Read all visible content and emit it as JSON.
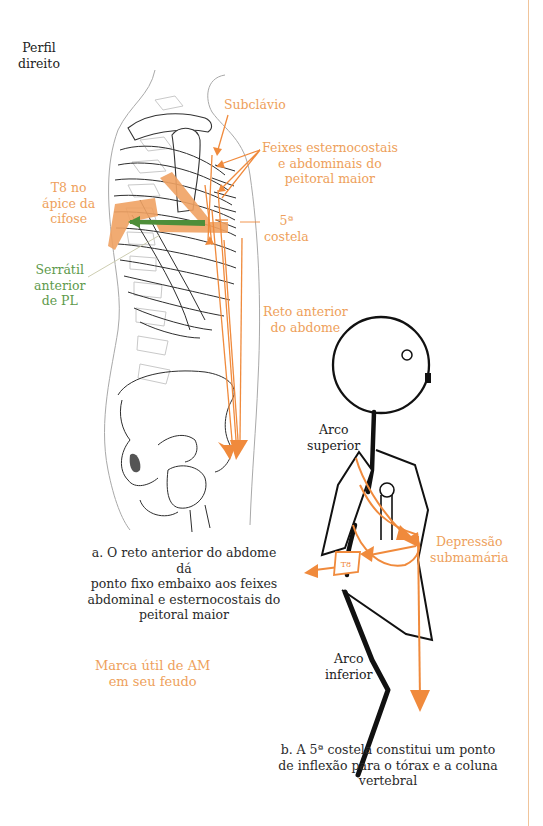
{
  "colors": {
    "accent_orange": "#ee9f5b",
    "arrow_orange": "#f08a3c",
    "muscle_green": "#4e8e3a",
    "ink": "#222222",
    "bone_gray": "#b8b8b8"
  },
  "figure_a": {
    "view_label": [
      "Perfil",
      "direito"
    ],
    "labels": {
      "subclavio": "Subclávio",
      "feixes": [
        "Feixes esternocostais",
        "e abdominais do",
        "peitoral maior"
      ],
      "t8": [
        "T8 no",
        "ápice da",
        "cifose"
      ],
      "costela": [
        "5ª",
        "costela"
      ],
      "serratil": [
        "Serrátil",
        "anterior",
        "de PL"
      ],
      "reto": [
        "Reto anterior",
        "do abdome"
      ]
    },
    "caption": [
      "a. O reto anterior do abdome dá",
      "ponto fixo embaixo aos feixes",
      "abdominal e esternocostais do",
      "peitoral maior"
    ]
  },
  "figure_b": {
    "labels": {
      "arco_superior": [
        "Arco",
        "superior"
      ],
      "arco_inferior": [
        "Arco",
        "inferior"
      ],
      "depressao": [
        "Depressão",
        "submamária"
      ],
      "t8_badge": "T8"
    },
    "caption": [
      "b. A 5ª costela constitui um ponto",
      "de inflexão para o tórax e a coluna",
      "vertebral"
    ]
  },
  "watermark": [
    "Marca útil de AM",
    "em seu feudo"
  ]
}
